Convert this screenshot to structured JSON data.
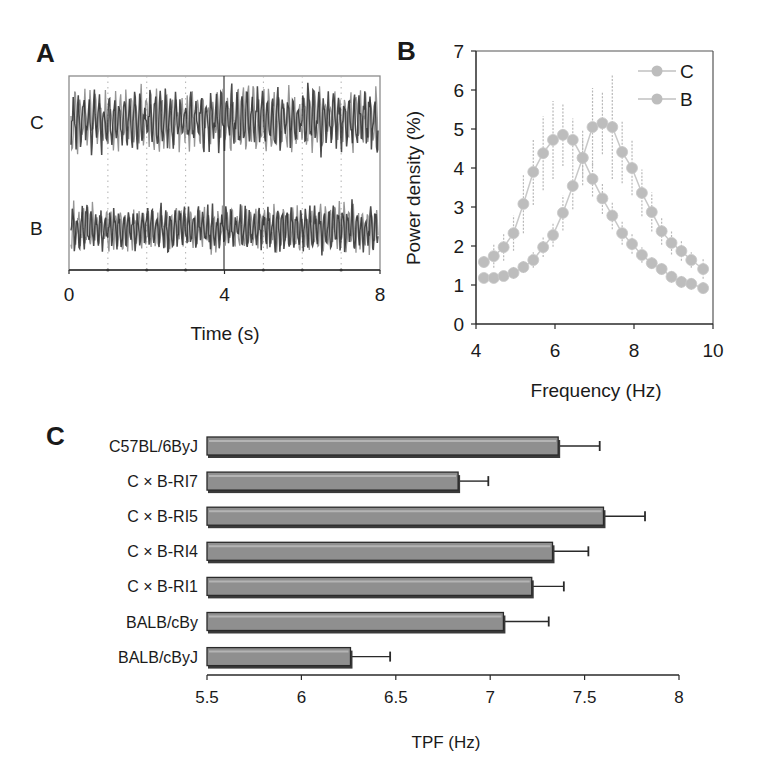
{
  "figure": {
    "panels": [
      {
        "letter": "A"
      },
      {
        "letter": "B"
      },
      {
        "letter": "C"
      }
    ]
  },
  "colors": {
    "axis": "#2a2a2a",
    "trace_dark": "#2b2b2b",
    "trace_light": "#8a8a8a",
    "series_marker": "#bdbdbd",
    "series_line": "#c8c8c8",
    "bar_fill": "#8f8f8f",
    "bar_edge": "#2a2a2a",
    "bar_shadow": "#3a3a3a",
    "grid_dotted": "#b0b0b0"
  },
  "chart_data": [
    {
      "id": "A",
      "type": "line",
      "title": "",
      "xlabel": "Time (s)",
      "ylabel": "",
      "xlim": [
        0,
        8
      ],
      "xticks": [
        "0",
        "4",
        "8"
      ],
      "xtick_values": [
        0,
        4,
        8
      ],
      "dotted_gridlines_x": [
        1,
        2,
        3,
        5,
        6,
        7
      ],
      "solid_marker_x": 4,
      "series": [
        {
          "name": "C",
          "description": "EEG trace, strain C",
          "amplitude": "larger"
        },
        {
          "name": "B",
          "description": "EEG trace, strain B",
          "amplitude": "smaller"
        }
      ],
      "row_labels": [
        "C",
        "B"
      ],
      "grid": false
    },
    {
      "id": "B",
      "type": "line",
      "title": "",
      "xlabel": "Frequency (Hz)",
      "ylabel": "Power density (%)",
      "xlim": [
        4,
        10
      ],
      "ylim": [
        0,
        7
      ],
      "xticks": [
        "4",
        "6",
        "8",
        "10"
      ],
      "xtick_values": [
        4,
        6,
        8,
        10
      ],
      "yticks": [
        "0",
        "1",
        "2",
        "3",
        "4",
        "5",
        "6",
        "7"
      ],
      "ytick_values": [
        0,
        1,
        2,
        3,
        4,
        5,
        6,
        7
      ],
      "legend": {
        "position": "upper right",
        "entries": [
          "C",
          "B"
        ]
      },
      "grid": false,
      "x": [
        4.2,
        4.45,
        4.7,
        4.95,
        5.2,
        5.45,
        5.7,
        5.95,
        6.2,
        6.45,
        6.7,
        6.95,
        7.2,
        7.45,
        7.7,
        7.95,
        8.2,
        8.45,
        8.7,
        8.95,
        9.2,
        9.45,
        9.75
      ],
      "series": [
        {
          "name": "C",
          "values": [
            1.59,
            1.74,
            1.97,
            2.33,
            3.08,
            3.9,
            4.38,
            4.72,
            4.85,
            4.72,
            4.26,
            3.72,
            3.22,
            2.78,
            2.33,
            2.05,
            1.77,
            1.56,
            1.41,
            1.21,
            1.08,
            1.03,
            0.92
          ],
          "errors": [
            0.15,
            0.3,
            0.35,
            0.45,
            0.75,
            0.85,
            0.95,
            1.0,
            0.8,
            0.55,
            0.5,
            0.45,
            0.4,
            0.35,
            0.3,
            0.25,
            0.2,
            0.15,
            0.15,
            0.15,
            0.15,
            0.15,
            0.15
          ]
        },
        {
          "name": "B",
          "values": [
            1.18,
            1.18,
            1.23,
            1.31,
            1.46,
            1.64,
            1.97,
            2.28,
            2.85,
            3.54,
            4.26,
            5.05,
            5.15,
            5.05,
            4.41,
            4.0,
            3.36,
            2.87,
            2.38,
            2.08,
            1.87,
            1.64,
            1.41
          ],
          "errors": [
            0.1,
            0.1,
            0.1,
            0.15,
            0.15,
            0.2,
            0.25,
            0.3,
            0.45,
            0.6,
            0.7,
            1.0,
            0.8,
            1.33,
            0.8,
            0.7,
            0.6,
            0.5,
            0.35,
            0.3,
            0.25,
            0.2,
            0.25
          ]
        }
      ]
    },
    {
      "id": "C",
      "type": "bar",
      "orientation": "horizontal",
      "title": "",
      "xlabel": "TPF (Hz)",
      "ylabel": "",
      "xlim": [
        5.5,
        8
      ],
      "xticks": [
        "5.5",
        "6",
        "6.5",
        "7",
        "7.5",
        "8"
      ],
      "xtick_values": [
        5.5,
        6,
        6.5,
        7,
        7.5,
        8
      ],
      "grid": false,
      "categories": [
        "C57BL/6ByJ",
        "C × B-RI7",
        "C × B-RI5",
        "C × B-RI4",
        "C × B-RI1",
        "BALB/cBy",
        "BALB/cByJ"
      ],
      "values": [
        7.36,
        6.83,
        7.6,
        7.33,
        7.22,
        7.07,
        6.26
      ],
      "errors": [
        0.22,
        0.16,
        0.22,
        0.19,
        0.17,
        0.24,
        0.21
      ]
    }
  ]
}
